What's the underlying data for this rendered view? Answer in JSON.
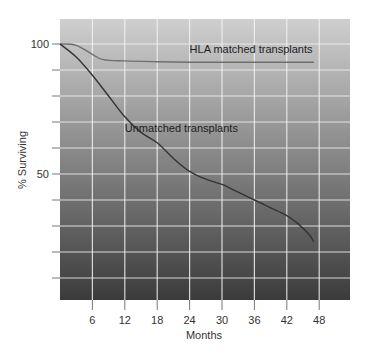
{
  "chart_data": {
    "type": "line",
    "title": "",
    "xlabel": "Months",
    "ylabel": "% Surviving",
    "xlim": [
      0,
      53
    ],
    "ylim": [
      0,
      110
    ],
    "x_ticks": [
      6,
      12,
      18,
      24,
      30,
      36,
      42,
      48
    ],
    "y_tick_labels": [
      {
        "value": 100,
        "label": "100"
      },
      {
        "value": 50,
        "label": "50"
      }
    ],
    "y_gridlines": [
      10,
      20,
      30,
      40,
      50,
      60,
      70,
      80,
      90,
      100
    ],
    "grid": true,
    "legend": "inline labels",
    "series": [
      {
        "name": "HLA matched transplants",
        "color": "#6e6e6e",
        "points": [
          [
            0,
            100
          ],
          [
            3,
            99.5
          ],
          [
            6,
            96
          ],
          [
            8,
            94
          ],
          [
            12,
            93.5
          ],
          [
            18,
            93.2
          ],
          [
            24,
            93
          ],
          [
            30,
            93
          ],
          [
            36,
            93
          ],
          [
            42,
            93
          ],
          [
            47,
            93
          ]
        ],
        "label_pos": [
          24,
          96.5
        ]
      },
      {
        "name": "Unmatched transplants",
        "color": "#333333",
        "points": [
          [
            0,
            100
          ],
          [
            3,
            95
          ],
          [
            6,
            88
          ],
          [
            9,
            80
          ],
          [
            12,
            72
          ],
          [
            15,
            66
          ],
          [
            18,
            62
          ],
          [
            21,
            56
          ],
          [
            24,
            51
          ],
          [
            27,
            48
          ],
          [
            30,
            46
          ],
          [
            33,
            43
          ],
          [
            36,
            40
          ],
          [
            39,
            37
          ],
          [
            42,
            34
          ],
          [
            44,
            31
          ],
          [
            46,
            27
          ],
          [
            47,
            24
          ]
        ],
        "label_pos": [
          12,
          66
        ]
      }
    ],
    "background": {
      "top_color": "#cfcfcf",
      "bottom_color": "#3b3b3b"
    }
  }
}
